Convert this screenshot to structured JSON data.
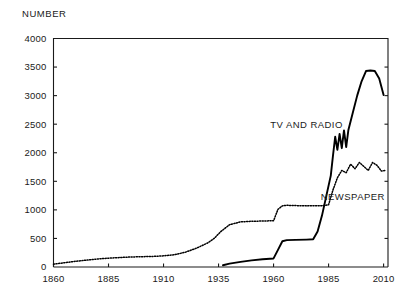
{
  "chart_data": {
    "type": "line",
    "title": "",
    "ylabel": "NUMBER",
    "xlabel": "",
    "xlim": [
      1860,
      2012
    ],
    "ylim": [
      0,
      4000
    ],
    "grid": false,
    "legend_position": "inline-annotations",
    "xticks": [
      1860,
      1885,
      1910,
      1935,
      1960,
      1985,
      2010
    ],
    "xtick_labels": [
      "1860",
      "1885",
      "1910",
      "1935",
      "1960",
      "1985",
      "2010"
    ],
    "yticks": [
      0,
      500,
      1000,
      1500,
      2000,
      2500,
      3000,
      3500,
      4000
    ],
    "ytick_labels": [
      "0",
      "500",
      "1000",
      "1500",
      "2000",
      "2500",
      "3000",
      "3500",
      "4000"
    ],
    "annotations": [
      {
        "text": "TV AND RADIO",
        "x": 1975,
        "y": 2430
      },
      {
        "text": "NEWSPAPER",
        "x": 1996,
        "y": 1180
      }
    ],
    "series": [
      {
        "name": "NEWSPAPER",
        "style": "dotted",
        "x": [
          1860,
          1865,
          1870,
          1875,
          1880,
          1885,
          1890,
          1895,
          1900,
          1905,
          1910,
          1915,
          1920,
          1925,
          1930,
          1933,
          1936,
          1940,
          1945,
          1950,
          1955,
          1958,
          1960,
          1962,
          1964,
          1966,
          1970,
          1975,
          1980,
          1983,
          1985,
          1987,
          1989,
          1991,
          1993,
          1995,
          1997,
          1999,
          2001,
          2003,
          2005,
          2007,
          2009,
          2011
        ],
        "values": [
          50,
          75,
          100,
          120,
          140,
          155,
          165,
          175,
          180,
          185,
          195,
          215,
          260,
          330,
          420,
          500,
          620,
          740,
          790,
          800,
          805,
          808,
          810,
          1010,
          1070,
          1080,
          1075,
          1070,
          1072,
          1075,
          1090,
          1350,
          1560,
          1690,
          1650,
          1800,
          1720,
          1830,
          1760,
          1690,
          1830,
          1780,
          1680,
          1690
        ]
      },
      {
        "name": "TV AND RADIO",
        "style": "solid",
        "x": [
          1937,
          1940,
          1945,
          1950,
          1955,
          1960,
          1962,
          1964,
          1966,
          1970,
          1975,
          1978,
          1980,
          1982,
          1984,
          1986,
          1987,
          1988,
          1989,
          1990,
          1991,
          1992,
          1993,
          1994,
          1996,
          1998,
          2000,
          2002,
          2004,
          2006,
          2008,
          2010
        ],
        "values": [
          30,
          60,
          90,
          115,
          135,
          150,
          300,
          450,
          470,
          475,
          480,
          485,
          620,
          900,
          1250,
          1600,
          1950,
          2280,
          2050,
          2330,
          2080,
          2390,
          2100,
          2400,
          2700,
          3000,
          3250,
          3430,
          3440,
          3430,
          3300,
          3010
        ]
      }
    ]
  }
}
